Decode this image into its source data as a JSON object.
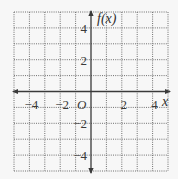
{
  "chart_data": {
    "type": "line",
    "title": "",
    "xlabel": "x",
    "ylabel": "f(x)",
    "origin_label": "O",
    "xlim": [
      -5,
      5
    ],
    "ylim": [
      -5,
      5
    ],
    "grid": true,
    "grid_style": "dotted",
    "grid_step": 1,
    "x_ticks": [
      {
        "value": -4,
        "label": "−4"
      },
      {
        "value": -2,
        "label": "−2"
      },
      {
        "value": 2,
        "label": "2"
      },
      {
        "value": 4,
        "label": "4"
      }
    ],
    "y_ticks": [
      {
        "value": 4,
        "label": "4"
      },
      {
        "value": 2,
        "label": "2"
      },
      {
        "value": -2,
        "label": "−2"
      },
      {
        "value": -4,
        "label": "−4"
      }
    ],
    "series": [],
    "colors": {
      "background": "#f7f7f7",
      "grid": "#6f6f6f",
      "axis": "#3a3a3a",
      "text": "#3a3a3a"
    }
  }
}
